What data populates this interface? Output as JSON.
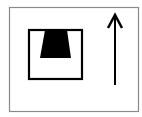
{
  "diagram": {
    "width": 142,
    "height": 117,
    "background": "#ffffff",
    "frame": {
      "x": 9.5,
      "y": 7.5,
      "w": 129,
      "h": 104,
      "stroke": "#8a8a8a",
      "stroke_width": 1.2
    },
    "box": {
      "x": 29,
      "y": 30,
      "w": 53,
      "h": 49,
      "stroke": "#000000",
      "stroke_width": 2.2
    },
    "trapezoid": {
      "points": "45,30 67,30 71,58 40,58",
      "fill": "#000000"
    },
    "arrow": {
      "direction": "up",
      "x": 115,
      "y_top": 15,
      "y_bottom": 85,
      "head_left": "108,28",
      "head_right": "122,28",
      "stroke": "#000000",
      "stroke_width": 2
    }
  }
}
